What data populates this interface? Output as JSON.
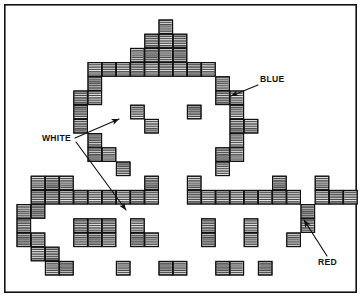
{
  "figure": {
    "background_color": "#ffffff",
    "ink_color": "#111111",
    "frame": {
      "x": 4,
      "y": 4,
      "width": 353,
      "height": 289
    },
    "grid": {
      "cell": 14.2,
      "origin_x": 17.0,
      "origin_y": 20.0
    },
    "block_style": {
      "fill_light": "#f2f2f2",
      "fill_mid": "#a8a8a8",
      "fill_dark": "#6e6e6e",
      "stripe_count": 5,
      "border_color": "#111111"
    },
    "callouts": [
      {
        "id": "blue",
        "label": "BLUE",
        "label_x": 260,
        "label_y": 82,
        "leader": [
          [
            258,
            85
          ],
          [
            240,
            92
          ]
        ],
        "arrow_tip": [
          231,
          96
        ],
        "arrow_angle": 205
      },
      {
        "id": "white",
        "label": "WHITE",
        "label_x": 42,
        "label_y": 141,
        "leader_a": [
          [
            75,
            138
          ],
          [
            112,
            122
          ]
        ],
        "arrow_a_tip": [
          119,
          119
        ],
        "arrow_a_angle": 335,
        "leader_b": [
          [
            76,
            142
          ],
          [
            120,
            202
          ]
        ],
        "arrow_b_tip": [
          126,
          210
        ],
        "arrow_b_angle": 54
      },
      {
        "id": "red",
        "label": "RED",
        "label_x": 318,
        "label_y": 265,
        "leader": [
          [
            327,
            256
          ],
          [
            309,
            228
          ]
        ],
        "arrow_tip": [
          304,
          220
        ],
        "arrow_angle": 238
      }
    ],
    "blocks": [
      [
        10,
        0
      ],
      [
        9,
        1
      ],
      [
        10,
        1
      ],
      [
        11,
        1
      ],
      [
        8,
        2
      ],
      [
        9,
        2
      ],
      [
        10,
        2
      ],
      [
        11,
        2
      ],
      [
        5,
        3
      ],
      [
        6,
        3
      ],
      [
        7,
        3
      ],
      [
        8,
        3
      ],
      [
        9,
        3
      ],
      [
        10,
        3
      ],
      [
        11,
        3
      ],
      [
        12,
        3
      ],
      [
        13,
        3
      ],
      [
        5,
        4
      ],
      [
        14,
        4
      ],
      [
        4,
        5
      ],
      [
        5,
        5
      ],
      [
        14,
        5
      ],
      [
        15,
        5
      ],
      [
        4,
        6
      ],
      [
        8,
        6
      ],
      [
        12,
        6
      ],
      [
        15,
        6
      ],
      [
        4,
        7
      ],
      [
        9,
        7
      ],
      [
        15,
        7
      ],
      [
        16,
        7
      ],
      [
        5,
        8
      ],
      [
        15,
        8
      ],
      [
        5,
        9
      ],
      [
        6,
        9
      ],
      [
        14,
        9
      ],
      [
        15,
        9
      ],
      [
        7,
        10
      ],
      [
        14,
        10
      ],
      [
        2,
        11
      ],
      [
        3,
        11
      ],
      [
        9,
        11
      ],
      [
        12,
        11
      ],
      [
        18,
        11
      ],
      [
        1,
        11
      ],
      [
        2,
        12
      ],
      [
        3,
        12
      ],
      [
        4,
        12
      ],
      [
        5,
        12
      ],
      [
        6,
        12
      ],
      [
        7,
        12
      ],
      [
        8,
        12
      ],
      [
        9,
        12
      ],
      [
        12,
        12
      ],
      [
        13,
        12
      ],
      [
        14,
        12
      ],
      [
        15,
        12
      ],
      [
        16,
        12
      ],
      [
        17,
        12
      ],
      [
        18,
        12
      ],
      [
        19,
        12
      ],
      [
        1,
        12
      ],
      [
        0,
        13
      ],
      [
        1,
        13
      ],
      [
        21,
        11
      ],
      [
        0,
        14
      ],
      [
        21,
        12
      ],
      [
        0,
        15
      ],
      [
        1,
        15
      ],
      [
        4,
        14
      ],
      [
        5,
        14
      ],
      [
        6,
        14
      ],
      [
        8,
        14
      ],
      [
        13,
        14
      ],
      [
        16,
        14
      ],
      [
        20,
        13
      ],
      [
        1,
        16
      ],
      [
        2,
        16
      ],
      [
        4,
        15
      ],
      [
        5,
        15
      ],
      [
        6,
        15
      ],
      [
        8,
        15
      ],
      [
        9,
        15
      ],
      [
        13,
        15
      ],
      [
        16,
        15
      ],
      [
        20,
        14
      ],
      [
        2,
        17
      ],
      [
        3,
        17
      ],
      [
        7,
        17
      ],
      [
        10,
        17
      ],
      [
        11,
        17
      ],
      [
        14,
        17
      ],
      [
        15,
        17
      ],
      [
        17,
        17
      ],
      [
        19,
        15
      ],
      [
        22,
        12
      ],
      [
        23,
        12
      ]
    ]
  }
}
